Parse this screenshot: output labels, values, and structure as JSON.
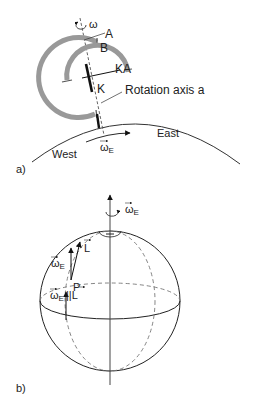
{
  "panel_a": {
    "panel_label": "a)",
    "omega_label": "ω",
    "label_A": "A",
    "label_B": "B",
    "label_KA": "KA",
    "label_K": "K",
    "rotation_axis_label": "Rotation axis a",
    "east_label": "East",
    "west_label": "West",
    "omega_E_main": "ω",
    "omega_E_sub": "E",
    "colors": {
      "ring": "#999999",
      "line": "#222222",
      "dashed": "#555555"
    }
  },
  "panel_b": {
    "panel_label": "b)",
    "axis_omega_main": "ω",
    "axis_omega_sub": "E",
    "vector_omega_main": "ω",
    "vector_omega_sub": "E",
    "vector_L": "L",
    "point_P": "P",
    "parallel_omega_main": "ω",
    "parallel_omega_sub": "E",
    "parallel_symbol": "||",
    "parallel_L": "L",
    "colors": {
      "sphere": "#222222",
      "dashed": "#777777",
      "axis": "#444444"
    }
  }
}
